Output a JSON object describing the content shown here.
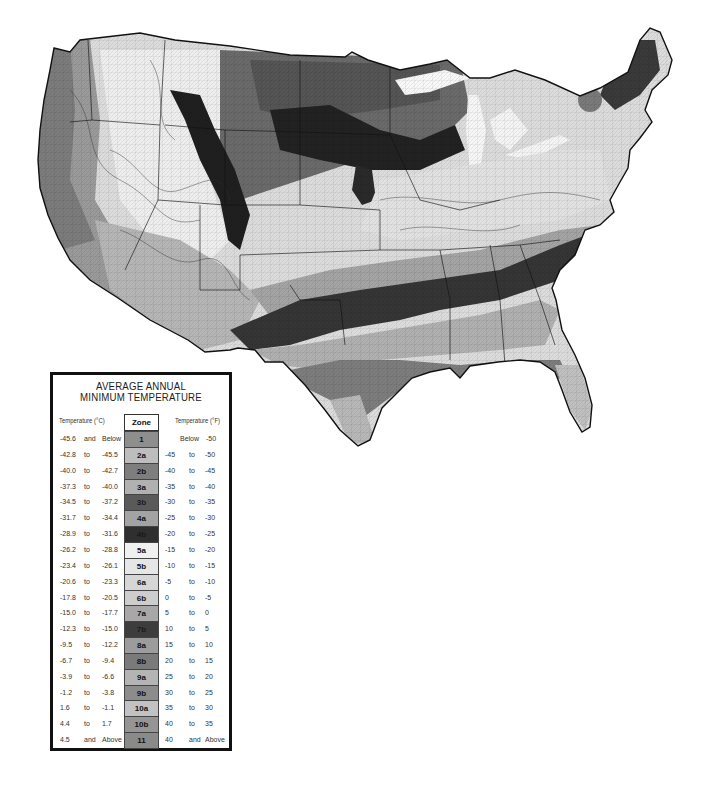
{
  "map": {
    "title": "USDA Plant Hardiness Zone Map",
    "region": "Contiguous United States",
    "style": "grayscale"
  },
  "legend": {
    "title_line1": "AVERAGE ANNUAL",
    "title_line2": "MINIMUM TEMPERATURE",
    "header_celsius": "Temperature (°C)",
    "header_zone": "Zone",
    "header_fahrenheit": "Temperature (°F)",
    "rows": [
      {
        "c_from": "-45.6",
        "c_sep": "and",
        "c_to": "Below",
        "zone": "1",
        "f_from": "Below",
        "f_sep": "",
        "f_to": "-50",
        "color": "#8e8e8e"
      },
      {
        "c_from": "-42.8",
        "c_sep": "to",
        "c_to": "-45.5",
        "zone": "2a",
        "f_from": "-45",
        "f_sep": "to",
        "f_to": "-50",
        "color": "#bdbdbd"
      },
      {
        "c_from": "-40.0",
        "c_sep": "to",
        "c_to": "-42.7",
        "zone": "2b",
        "f_from": "-40",
        "f_sep": "to",
        "f_to": "-45",
        "color": "#7e7e7e"
      },
      {
        "c_from": "-37.3",
        "c_sep": "to",
        "c_to": "-40.0",
        "zone": "3a",
        "f_from": "-35",
        "f_sep": "to",
        "f_to": "-40",
        "color": "#b1b1b1"
      },
      {
        "c_from": "-34.5",
        "c_sep": "to",
        "c_to": "-37.2",
        "zone": "3b",
        "f_from": "-30",
        "f_sep": "to",
        "f_to": "-35",
        "color": "#5a5a5a"
      },
      {
        "c_from": "-31.7",
        "c_sep": "to",
        "c_to": "-34.4",
        "zone": "4a",
        "f_from": "-25",
        "f_sep": "to",
        "f_to": "-30",
        "color": "#a3a3a3"
      },
      {
        "c_from": "-28.9",
        "c_sep": "to",
        "c_to": "-31.6",
        "zone": "4b",
        "f_from": "-20",
        "f_sep": "to",
        "f_to": "-25",
        "color": "#2f2f2f"
      },
      {
        "c_from": "-26.2",
        "c_sep": "to",
        "c_to": "-28.8",
        "zone": "5a",
        "f_from": "-15",
        "f_sep": "to",
        "f_to": "-20",
        "color": "#f0f0f0"
      },
      {
        "c_from": "-23.4",
        "c_sep": "to",
        "c_to": "-26.1",
        "zone": "5b",
        "f_from": "-10",
        "f_sep": "to",
        "f_to": "-15",
        "color": "#e6e6e6"
      },
      {
        "c_from": "-20.6",
        "c_sep": "to",
        "c_to": "-23.3",
        "zone": "6a",
        "f_from": "-5",
        "f_sep": "to",
        "f_to": "-10",
        "color": "#d6d6d6"
      },
      {
        "c_from": "-17.8",
        "c_sep": "to",
        "c_to": "-20.5",
        "zone": "6b",
        "f_from": "0",
        "f_sep": "to",
        "f_to": "-5",
        "color": "#cdcdcd"
      },
      {
        "c_from": "-15.0",
        "c_sep": "to",
        "c_to": "-17.7",
        "zone": "7a",
        "f_from": "5",
        "f_sep": "to",
        "f_to": "0",
        "color": "#a8a8a8"
      },
      {
        "c_from": "-12.3",
        "c_sep": "to",
        "c_to": "-15.0",
        "zone": "7b",
        "f_from": "10",
        "f_sep": "to",
        "f_to": "5",
        "color": "#3d3d3d"
      },
      {
        "c_from": "-9.5",
        "c_sep": "to",
        "c_to": "-12.2",
        "zone": "8a",
        "f_from": "15",
        "f_sep": "to",
        "f_to": "10",
        "color": "#9c9c9c"
      },
      {
        "c_from": "-6.7",
        "c_sep": "to",
        "c_to": "-9.4",
        "zone": "8b",
        "f_from": "20",
        "f_sep": "to",
        "f_to": "15",
        "color": "#7a7a7a"
      },
      {
        "c_from": "-3.9",
        "c_sep": "to",
        "c_to": "-6.6",
        "zone": "9a",
        "f_from": "25",
        "f_sep": "to",
        "f_to": "20",
        "color": "#b4b4b4"
      },
      {
        "c_from": "-1.2",
        "c_sep": "to",
        "c_to": "-3.8",
        "zone": "9b",
        "f_from": "30",
        "f_sep": "to",
        "f_to": "25",
        "color": "#8c8c8c"
      },
      {
        "c_from": "1.6",
        "c_sep": "to",
        "c_to": "-1.1",
        "zone": "10a",
        "f_from": "35",
        "f_sep": "to",
        "f_to": "30",
        "color": "#c2c2c2"
      },
      {
        "c_from": "4.4",
        "c_sep": "to",
        "c_to": "1.7",
        "zone": "10b",
        "f_from": "40",
        "f_sep": "to",
        "f_to": "35",
        "color": "#959595"
      },
      {
        "c_from": "4.5",
        "c_sep": "and",
        "c_to": "Above",
        "zone": "11",
        "f_from": "40",
        "f_sep": "and",
        "f_to": "Above",
        "color": "#8a8a8a"
      }
    ]
  }
}
